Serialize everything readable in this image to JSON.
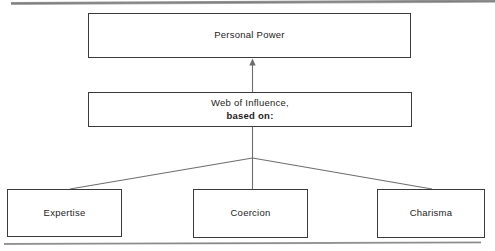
{
  "diagram": {
    "nodes": {
      "personal_power": {
        "label": "Personal Power"
      },
      "web_of_influence": {
        "line_1": "Web of Influence,",
        "line_2": "based on:"
      },
      "expertise": {
        "label": "Expertise"
      },
      "coercion": {
        "label": "Coercion"
      },
      "charisma": {
        "label": "Charisma"
      }
    },
    "connectors": {
      "arrow_up_label": "arrow-up-to-personal-power",
      "branch_left_label": "branch-to-expertise",
      "branch_center_label": "branch-to-coercion",
      "branch_right_label": "branch-to-charisma"
    },
    "colors": {
      "box_border": "#3b3b3b",
      "connector_line": "#6e6e6e",
      "page_rule": "#8e8e8e",
      "text": "#1d1d1d",
      "background": "#ffffff"
    }
  }
}
